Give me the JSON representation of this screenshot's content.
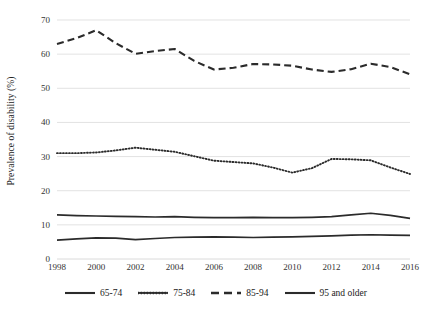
{
  "chart_data": {
    "type": "line",
    "title": "",
    "xlabel": "",
    "ylabel": "Prevalence of disability (%)",
    "ylim": [
      0,
      70
    ],
    "ytick_step": 10,
    "yticks": [
      0,
      10,
      20,
      30,
      40,
      50,
      60,
      70
    ],
    "xlim": [
      1998,
      2016
    ],
    "xticks": [
      1998,
      2000,
      2002,
      2004,
      2006,
      2008,
      2010,
      2012,
      2014,
      2016
    ],
    "x": [
      1998,
      1999,
      2000,
      2001,
      2002,
      2003,
      2004,
      2005,
      2006,
      2007,
      2008,
      2009,
      2010,
      2011,
      2012,
      2013,
      2014,
      2015,
      2016
    ],
    "grid": "horizontal",
    "legend_position": "bottom",
    "series": [
      {
        "name": "65-74",
        "style": "solid",
        "color": "#2b2b2b",
        "values": [
          12.9,
          12.7,
          12.6,
          12.5,
          12.4,
          12.3,
          12.4,
          12.2,
          12.1,
          12.1,
          12.2,
          12.1,
          12.1,
          12.2,
          12.4,
          12.9,
          13.4,
          12.8,
          11.9
        ]
      },
      {
        "name": "75-84",
        "style": "dotted",
        "color": "#2b2b2b",
        "values": [
          31.0,
          31.0,
          31.2,
          31.8,
          32.6,
          32.0,
          31.4,
          30.1,
          28.8,
          28.4,
          28.0,
          26.8,
          25.3,
          26.6,
          29.3,
          29.2,
          28.9,
          26.8,
          24.9
        ]
      },
      {
        "name": "85-94",
        "style": "dashed",
        "color": "#2b2b2b",
        "values": [
          63.0,
          64.7,
          67.0,
          63.2,
          60.1,
          60.9,
          61.5,
          58.0,
          55.5,
          56.0,
          57.1,
          57.0,
          56.6,
          55.5,
          54.8,
          55.6,
          57.2,
          56.2,
          54.1
        ]
      },
      {
        "name": "95 and older",
        "style": "solid",
        "color": "#2b2b2b",
        "values": [
          5.5,
          5.9,
          6.2,
          6.1,
          5.7,
          6.0,
          6.3,
          6.4,
          6.5,
          6.4,
          6.3,
          6.4,
          6.5,
          6.6,
          6.8,
          7.0,
          7.1,
          7.0,
          6.9
        ]
      }
    ]
  },
  "legend": {
    "items": [
      {
        "label": "65-74",
        "style": "solid",
        "icon": "solid-line-icon"
      },
      {
        "label": "75-84",
        "style": "dotted",
        "icon": "dotted-line-icon"
      },
      {
        "label": "85-94",
        "style": "dashed",
        "icon": "dashed-line-icon"
      },
      {
        "label": "95 and older",
        "style": "solid",
        "icon": "solid-line-icon"
      }
    ]
  },
  "axes": {
    "y_title": "Prevalence of disability (%)",
    "y_tick_labels": [
      "70",
      "60",
      "50",
      "40",
      "30",
      "20",
      "10",
      "0"
    ],
    "x_tick_labels": [
      "1998",
      "2000",
      "2002",
      "2004",
      "2006",
      "2008",
      "2010",
      "2012",
      "2014",
      "2016"
    ]
  },
  "colors": {
    "line": "#2b2b2b",
    "grid": "#d6d6d6",
    "axis_text": "#333333",
    "background": "#ffffff"
  }
}
